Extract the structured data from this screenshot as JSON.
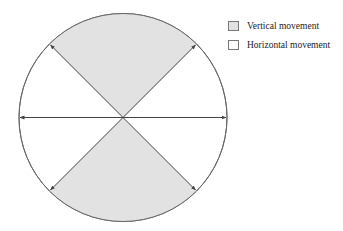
{
  "colors": {
    "vertical_fill": "#e2e2e2",
    "horizontal_fill": "#ffffff",
    "stroke": "#555555",
    "arrow": "#444444"
  },
  "legend": {
    "items": [
      {
        "label": "Vertical movement",
        "swatch_color": "#e2e2e2"
      },
      {
        "label": "Horizontal movement",
        "swatch_color": "#ffffff"
      }
    ]
  },
  "diagram": {
    "shape": "circle divided into four sectors by two diagonals and a horizontal diameter",
    "sectors": [
      {
        "position": "top",
        "category": "Vertical movement",
        "shaded": true
      },
      {
        "position": "bottom",
        "category": "Vertical movement",
        "shaded": true
      },
      {
        "position": "left",
        "category": "Horizontal movement",
        "shaded": false
      },
      {
        "position": "right",
        "category": "Horizontal movement",
        "shaded": false
      }
    ],
    "arrows": [
      "horizontal double-headed",
      "diagonal upper-left to lower-right double-headed",
      "diagonal upper-right to lower-left double-headed"
    ]
  }
}
